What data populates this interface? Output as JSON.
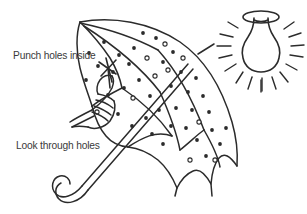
{
  "illustration": {
    "title": "Pinhole umbrella light demonstration",
    "background_color": "#ffffff",
    "ink_color": "#2b2b2b",
    "labels": {
      "punch": "Punch holes inside",
      "look": "Look through holes"
    },
    "objects": [
      {
        "name": "umbrella",
        "description": "open umbrella with perforated canopy, curved hook handle"
      },
      {
        "name": "hand",
        "description": "hand holding punch tool at canopy edge"
      },
      {
        "name": "punch-tool",
        "description": "pointed punch making holes in fabric"
      },
      {
        "name": "light-bulb",
        "description": "hanging light bulb with radiating rays"
      }
    ],
    "holes_count": 47,
    "ray_count": 16
  }
}
